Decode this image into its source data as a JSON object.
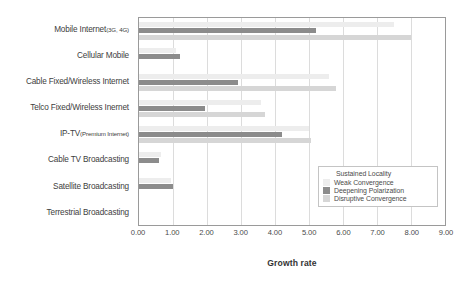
{
  "chart_data": {
    "type": "bar",
    "orientation": "horizontal",
    "title": "",
    "xlabel": "Growth rate",
    "ylabel": "",
    "xlim": [
      0.0,
      9.0
    ],
    "xtick_step": 1.0,
    "xticks": [
      "0.00",
      "1.00",
      "2.00",
      "3.00",
      "4.00",
      "5.00",
      "6.00",
      "7.00",
      "8.00",
      "9.00"
    ],
    "grid": "vertical",
    "legend_position": "inside-lower-right",
    "legend_title": "Sustained Locality",
    "categories": [
      "Mobile Internet(3G, 4G)",
      "Cellular Mobile",
      "Cable Fixed/Wireless Internet",
      "Telco Fixed/Wireless Inernet",
      "IP-TV(Premium Internet)",
      "Cable TV Broadcasting",
      "Satellite Broadcasting",
      "Terrestrial Broadcasting"
    ],
    "category_labels": [
      {
        "main": "Mobile Internet",
        "sub": "(3G, 4G)"
      },
      {
        "main": "Cellular Mobile",
        "sub": ""
      },
      {
        "main": "Cable Fixed/Wireless Internet",
        "sub": ""
      },
      {
        "main": "Telco Fixed/Wireless Inernet",
        "sub": ""
      },
      {
        "main": "IP-TV",
        "sub": "(Premium Internet)"
      },
      {
        "main": "Cable TV Broadcasting",
        "sub": ""
      },
      {
        "main": "Satellite Broadcasting",
        "sub": ""
      },
      {
        "main": "Terrestrial Broadcasting",
        "sub": ""
      }
    ],
    "series": [
      {
        "name": "Weak Convergence",
        "color": "#ededed",
        "values": [
          7.5,
          1.1,
          5.6,
          3.6,
          5.0,
          0.65,
          0.95,
          0.0
        ]
      },
      {
        "name": "Deepening Polarization",
        "color": "#8c8c8c",
        "values": [
          5.2,
          1.2,
          2.9,
          1.95,
          4.2,
          0.6,
          1.0,
          0.0
        ]
      },
      {
        "name": "Disruptive Convergence",
        "color": "#d6d6d6",
        "values": [
          8.0,
          0.0,
          5.8,
          3.7,
          5.05,
          0.0,
          0.0,
          0.0
        ]
      }
    ]
  },
  "colors": {
    "axis": "#9a9a9a",
    "gridline": "#dcdcdc",
    "text": "#4a4a4a",
    "legend_border": "#c4c4c4",
    "background": "#ffffff"
  }
}
